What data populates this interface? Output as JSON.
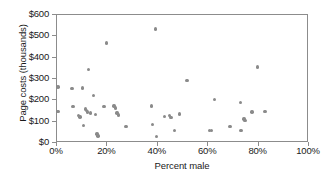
{
  "chart_data": {
    "type": "scatter",
    "title": "",
    "xlabel": "Percent male",
    "ylabel": "Page costs (thousands)",
    "xlim": [
      0,
      100
    ],
    "ylim": [
      0,
      600
    ],
    "xtick_labels": [
      "0%",
      "20%",
      "40%",
      "60%",
      "80%",
      "100%"
    ],
    "xtick_values": [
      0,
      20,
      40,
      60,
      80,
      100
    ],
    "ytick_labels": [
      "$0",
      "$100",
      "$200",
      "$300",
      "$400",
      "$500",
      "$600"
    ],
    "ytick_values": [
      0,
      100,
      200,
      300,
      400,
      500,
      600
    ],
    "grid": false,
    "legend": "none",
    "marker_color": "#8a8a8a",
    "axis_color": "#8c8c8c",
    "points": [
      {
        "x": 0.4,
        "y": 262
      },
      {
        "x": 0.4,
        "y": 148
      },
      {
        "x": 6.0,
        "y": 256
      },
      {
        "x": 6.3,
        "y": 170
      },
      {
        "x": 8.5,
        "y": 128
      },
      {
        "x": 9.2,
        "y": 122
      },
      {
        "x": 10.2,
        "y": 257
      },
      {
        "x": 10.4,
        "y": 82
      },
      {
        "x": 11.2,
        "y": 160
      },
      {
        "x": 11.6,
        "y": 152
      },
      {
        "x": 12.0,
        "y": 146
      },
      {
        "x": 12.4,
        "y": 345
      },
      {
        "x": 13.2,
        "y": 140
      },
      {
        "x": 14.6,
        "y": 222
      },
      {
        "x": 15.2,
        "y": 135
      },
      {
        "x": 15.8,
        "y": 42
      },
      {
        "x": 16.2,
        "y": 33
      },
      {
        "x": 18.6,
        "y": 170
      },
      {
        "x": 19.6,
        "y": 468
      },
      {
        "x": 22.6,
        "y": 173
      },
      {
        "x": 23.2,
        "y": 165
      },
      {
        "x": 23.8,
        "y": 140
      },
      {
        "x": 24.4,
        "y": 132
      },
      {
        "x": 27.4,
        "y": 78
      },
      {
        "x": 37.6,
        "y": 173
      },
      {
        "x": 37.8,
        "y": 88
      },
      {
        "x": 39.2,
        "y": 535
      },
      {
        "x": 39.6,
        "y": 30
      },
      {
        "x": 42.6,
        "y": 124
      },
      {
        "x": 44.6,
        "y": 128
      },
      {
        "x": 45.2,
        "y": 120
      },
      {
        "x": 46.6,
        "y": 58
      },
      {
        "x": 48.6,
        "y": 136
      },
      {
        "x": 51.6,
        "y": 292
      },
      {
        "x": 60.4,
        "y": 60
      },
      {
        "x": 61.2,
        "y": 58
      },
      {
        "x": 62.4,
        "y": 205
      },
      {
        "x": 68.6,
        "y": 77
      },
      {
        "x": 72.8,
        "y": 191
      },
      {
        "x": 73.0,
        "y": 60
      },
      {
        "x": 74.2,
        "y": 112
      },
      {
        "x": 74.6,
        "y": 105
      },
      {
        "x": 77.4,
        "y": 146
      },
      {
        "x": 79.6,
        "y": 357
      },
      {
        "x": 82.6,
        "y": 147
      }
    ]
  }
}
